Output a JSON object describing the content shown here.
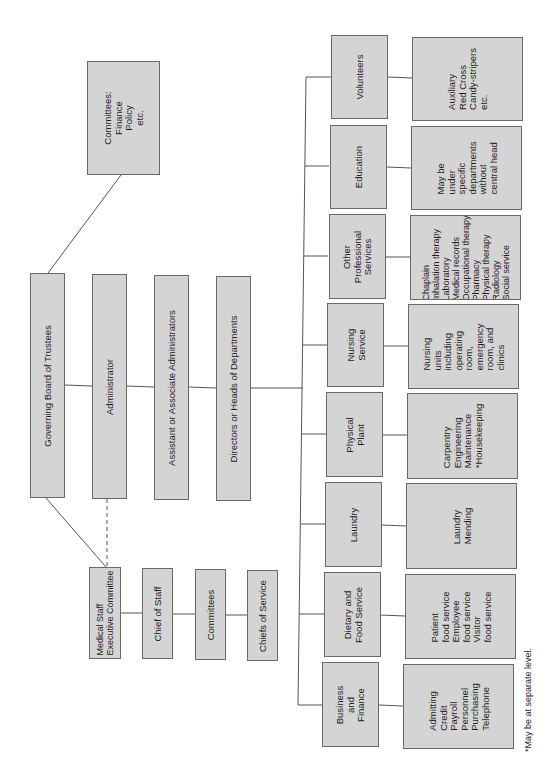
{
  "colors": {
    "box_fill": "#d4d4d4",
    "box_border": "#6a6a6a",
    "line": "#555555",
    "text": "#1e1e1e"
  },
  "top_chain": {
    "board": "Governing Board of Trustees",
    "administrator": "Administrator",
    "assistant": "Assistant or Associate Administrators",
    "directors": "Directors or Heads of Departments"
  },
  "board_committees": "Committees:\nFinance\nPolicy\netc.",
  "medical_staff": {
    "executive_committee": "Medical Staff\nExecutive Committee",
    "chief_of_staff": "Chief of Staff",
    "committees": "Committees",
    "chiefs_of_service": "Chiefs of Service"
  },
  "departments": [
    {
      "name": "Volunteers",
      "details": "Auxiliary\nRed Cross\nCandy-stripers\netc."
    },
    {
      "name": "Education",
      "details": "May be\nunder\nspecific\ndepartments\nwithout\ncentral head"
    },
    {
      "name": "Other\nProfessional\nServices",
      "details": "Chaplain\nInhalation therapy\nLaboratory\nMedical records\nOccupational therapy\nPharmacy\nPhysical therapy\nRadiology\nSocial service"
    },
    {
      "name": "Nursing\nService",
      "details": "Nursing\nunits\nincluding\noperating\nroom,\nemergency\nroom, and\nclinics"
    },
    {
      "name": "Physical\nPlant",
      "details": "Carpentry\nEngineering\nMaintenance\n*Housekeeping"
    },
    {
      "name": "Laundry",
      "details": "Laundry\nMending"
    },
    {
      "name": "Dietary and\nFood Service",
      "details": "Patient\nfood service\nEmployee\nfood service\nVisitor\nfood service"
    },
    {
      "name": "Business\nand\nFinance",
      "details": "Admitting\nCredit\nPayroll\nPersonnel\nPurchasing\nTelephone"
    }
  ],
  "footnote": "*May be at separate level."
}
